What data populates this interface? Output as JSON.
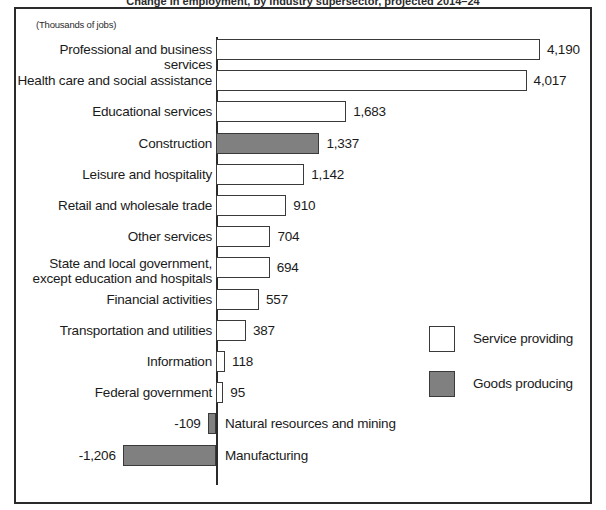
{
  "figure": {
    "title_sliver": "Change in employment, by industry supersector, projected 2014–24",
    "units_note": "(Thousands of jobs)"
  },
  "legend": {
    "position": "inside-right",
    "items": [
      {
        "label": "Service providing",
        "type": "service",
        "color": "#ffffff"
      },
      {
        "label": "Goods producing",
        "type": "goods",
        "color": "#808080"
      }
    ]
  },
  "chart_data": {
    "type": "bar",
    "orientation": "horizontal",
    "title": "Change in employment, by industry supersector, projected 2014–24",
    "xlabel": "",
    "ylabel": "",
    "units": "(Thousands of jobs)",
    "grid": false,
    "xlim": [
      -1206,
      4190
    ],
    "categories": [
      "Professional and business services",
      "Health care and social assistance",
      "Educational services",
      "Construction",
      "Leisure and hospitality",
      "Retail and wholesale trade",
      "Other services",
      "State and local government,\nexcept education and hospitals",
      "Financial activities",
      "Transportation and utilities",
      "Information",
      "Federal government",
      "Natural resources and mining",
      "Manufacturing"
    ],
    "values": [
      4190,
      4017,
      1683,
      1337,
      1142,
      910,
      704,
      694,
      557,
      387,
      118,
      95,
      -109,
      -1206
    ],
    "value_labels": [
      "4,190",
      "4,017",
      "1,683",
      "1,337",
      "1,142",
      "910",
      "704",
      "694",
      "557",
      "387",
      "118",
      "95",
      "-109",
      "-1,206"
    ],
    "series_group": [
      "service",
      "service",
      "service",
      "goods",
      "service",
      "service",
      "service",
      "service",
      "service",
      "service",
      "service",
      "service",
      "goods",
      "goods"
    ],
    "legend": [
      "Service providing",
      "Goods producing"
    ],
    "colors": {
      "service": "#ffffff",
      "goods": "#808080",
      "outline": "#3a3a3a"
    }
  }
}
